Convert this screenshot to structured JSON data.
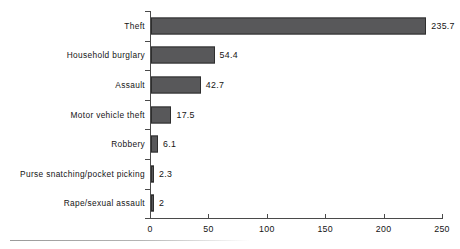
{
  "chart_data": {
    "type": "bar",
    "orientation": "horizontal",
    "title": "",
    "subtitle": "",
    "xlabel": "",
    "ylabel": "",
    "categories": [
      "Theft",
      "Household burglary",
      "Assault",
      "Motor vehicle theft",
      "Robbery",
      "Purse snatching/pocket picking",
      "Rape/sexual assault"
    ],
    "values": [
      235.7,
      54.4,
      42.7,
      17.5,
      6.1,
      2.3,
      2
    ],
    "value_labels": [
      "235.7",
      "54.4",
      "42.7",
      "17.5",
      "6.1",
      "2.3",
      "2"
    ],
    "xlim": [
      0,
      250
    ],
    "xticks": [
      0,
      50,
      100,
      150,
      200,
      250
    ],
    "xtick_labels": [
      "0",
      "50",
      "100",
      "150",
      "200",
      "250"
    ],
    "grid": false,
    "legend": null,
    "bar_color": "#58585a",
    "bar_edge_color": "#2e2e2e",
    "axis_color": "#4a4a4a",
    "background_color": "#ffffff"
  }
}
